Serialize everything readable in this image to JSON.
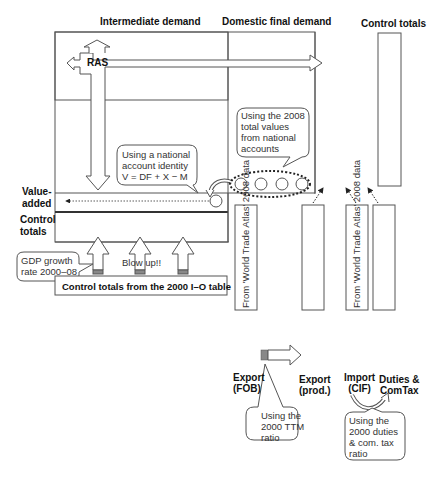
{
  "headers": {
    "intermediate_demand": "Intermediate demand",
    "domestic_final_demand": "Domestic final demand",
    "control_totals": "Control totals"
  },
  "ras": {
    "label": "RAS"
  },
  "row_labels": {
    "value_added_1": "Value-",
    "value_added_2": "added",
    "control_totals_1": "Control",
    "control_totals_2": "totals"
  },
  "callouts": {
    "national_identity": [
      "Using a national",
      "account identity",
      "V = DF + X − M"
    ],
    "national_accounts": [
      "Using the 2008",
      "total values",
      "from national",
      "accounts"
    ],
    "gdp_growth": [
      "GDP growth",
      "rate 2000–08"
    ],
    "blow_up": "Blow up!!",
    "ttm": [
      "Using the",
      "2000 TTM",
      "ratio"
    ],
    "duties": [
      "Using the",
      "2000 duties",
      "& com. tax",
      "ratio"
    ]
  },
  "bottom_box": {
    "label": "Control totals from the 2000 I–O table"
  },
  "columns": {
    "export_fob": {
      "source": "From  'World Trade Atlas' 2008 data",
      "label_1": "Export",
      "label_2": "(FOB)"
    },
    "export_prod": {
      "label_1": "Export",
      "label_2": "(prod.)"
    },
    "import_cif": {
      "source": "From  'World Trade Atlas' 2008 data",
      "label_1": "Import",
      "label_2": "(CIF)"
    },
    "duties_comtax": {
      "label_1": "Duties &",
      "label_2": "ComTax"
    }
  },
  "colors": {
    "stroke": "#555555",
    "text": "#111111",
    "background": "#ffffff"
  }
}
